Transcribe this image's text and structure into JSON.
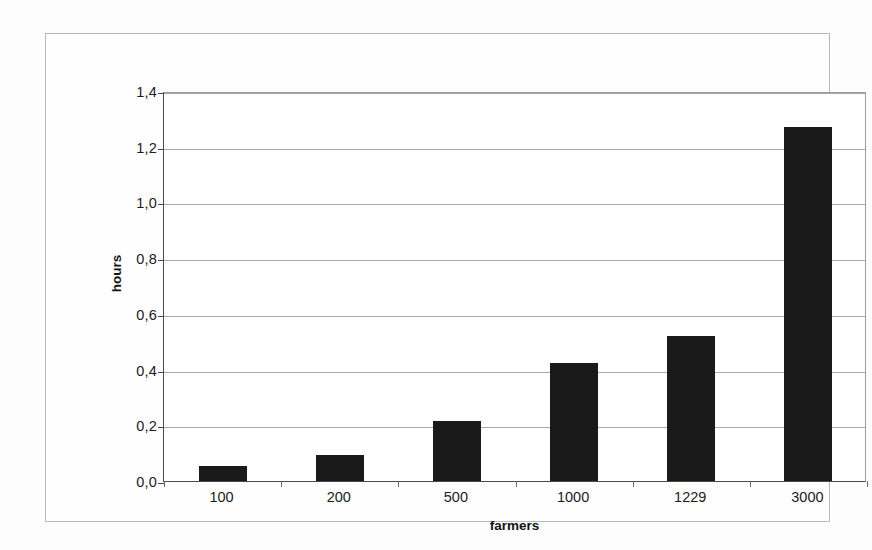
{
  "chart_data": {
    "type": "bar",
    "title": "",
    "subtitle": "",
    "xlabel": "farmers",
    "ylabel": "hours",
    "categories": [
      "100",
      "200",
      "500",
      "1000",
      "1229",
      "3000"
    ],
    "values": [
      0.055,
      0.095,
      0.215,
      0.425,
      0.52,
      1.27
    ],
    "series": [
      {
        "name": "hours",
        "values": [
          0.055,
          0.095,
          0.215,
          0.425,
          0.52,
          1.27
        ]
      }
    ],
    "ylim": [
      0.0,
      1.4
    ],
    "ytick_labels": [
      "0,0",
      "0,2",
      "0,4",
      "0,6",
      "0,8",
      "1,0",
      "1,2",
      "1,4"
    ],
    "ytick_values": [
      0.0,
      0.2,
      0.4,
      0.6,
      0.8,
      1.0,
      1.2,
      1.4
    ],
    "grid": true,
    "grid_axis": "y",
    "legend": false,
    "legend_position": "none",
    "bar_color": "#1a1a1a",
    "gridline_color": "#a8a8a8",
    "axis_color": "#4a4a4a",
    "plot_background": "#ffffff",
    "decimal_separator": ","
  },
  "figure": {
    "border_color": "#b9b9b9",
    "background": "#fdfdfd"
  }
}
